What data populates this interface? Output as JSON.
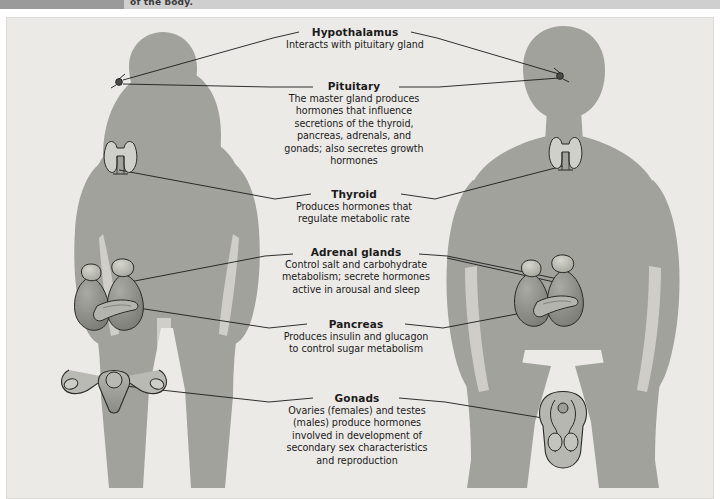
{
  "header": {
    "cropped_text": "of the body."
  },
  "figure": {
    "background_color": "#eceae6",
    "silhouette_color": "#9fa09a",
    "organ_color": "#8c8d86",
    "line_color": "#1b1b1b",
    "text_color": "#1b1b1b"
  },
  "figures": [
    {
      "name": "female-silhouette",
      "side": "left"
    },
    {
      "name": "male-silhouette",
      "side": "right"
    }
  ],
  "labels": [
    {
      "id": "hypothalamus",
      "title": "Hypothalamus",
      "lines": [
        "Interacts with pituitary gland"
      ]
    },
    {
      "id": "pituitary",
      "title": "Pituitary",
      "lines": [
        "The master gland produces",
        "hormones that influence",
        "secretions of the thyroid,",
        "pancreas, adrenals, and",
        "gonads; also secretes growth",
        "hormones"
      ]
    },
    {
      "id": "thyroid",
      "title": "Thyroid",
      "lines": [
        "Produces hormones that",
        "regulate metabolic rate"
      ]
    },
    {
      "id": "adrenal-glands",
      "title": "Adrenal glands",
      "lines": [
        "Control salt and carbohydrate",
        "metabolism; secrete hormones",
        "active in arousal and sleep"
      ]
    },
    {
      "id": "pancreas",
      "title": "Pancreas",
      "lines": [
        "Produces insulin and glucagon",
        "to control sugar metabolism"
      ]
    },
    {
      "id": "gonads",
      "title": "Gonads",
      "lines": [
        "Ovaries (females) and testes",
        "(males) produce hormones",
        "involved in development of",
        "secondary sex characteristics",
        "and reproduction"
      ]
    }
  ],
  "organs": [
    {
      "id": "pituitary-marker-female",
      "label": "Pituitary gland marker (female head)"
    },
    {
      "id": "pituitary-marker-male",
      "label": "Pituitary gland marker (male head)"
    },
    {
      "id": "thyroid-female",
      "label": "Thyroid gland (female neck)"
    },
    {
      "id": "thyroid-male",
      "label": "Thyroid gland (male neck)"
    },
    {
      "id": "kidneys-adrenals-female",
      "label": "Kidneys with adrenal glands and pancreas (female)"
    },
    {
      "id": "kidneys-adrenals-male",
      "label": "Kidneys with adrenal glands and pancreas (male)"
    },
    {
      "id": "ovaries-uterus",
      "label": "Uterus and ovaries (female gonads)"
    },
    {
      "id": "testes",
      "label": "Testes (male gonads)"
    }
  ]
}
